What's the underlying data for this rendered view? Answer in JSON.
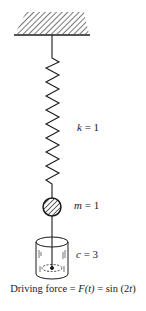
{
  "diagram": {
    "type": "spring-mass-damper",
    "labels": {
      "spring": {
        "var": "k",
        "eq": " = ",
        "val": "1"
      },
      "mass": {
        "var": "m",
        "eq": " = ",
        "val": "1"
      },
      "damper": {
        "var": "c",
        "eq": " = ",
        "val": "3"
      }
    },
    "caption": {
      "prefix": "Driving force = ",
      "func": "F(t)",
      "mid": " = sin (2",
      "t": "t",
      "suffix": ")"
    },
    "colors": {
      "line": "#1a1a1a",
      "background": "#ffffff"
    }
  }
}
